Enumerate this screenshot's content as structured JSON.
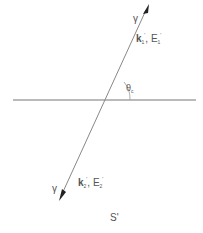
{
  "diagram": {
    "interface_line": {
      "x1": 13,
      "y1": 100,
      "x2": 196,
      "y2": 100,
      "color": "#777777"
    },
    "ray": {
      "x1": 60,
      "y1": 198,
      "x2": 148,
      "y2": 5,
      "color": "#888888"
    },
    "labels": {
      "top_gamma": "γ",
      "top_wave_k": "k",
      "top_wave_k_sub": "1",
      "top_wave_k_sup": "'",
      "top_wave_sep": ", ",
      "top_wave_E": "E",
      "top_wave_E_sub": "1",
      "top_wave_E_sup": "'",
      "angle_symbol": "θ",
      "angle_sub": "c",
      "bottom_gamma": "γ",
      "bottom_wave_k": "k",
      "bottom_wave_k_sub": "2",
      "bottom_wave_k_sup": "'",
      "bottom_wave_sep": ", ",
      "bottom_wave_E": "E",
      "bottom_wave_E_sub": "2",
      "bottom_wave_E_sup": "'",
      "frame": "S'"
    }
  }
}
